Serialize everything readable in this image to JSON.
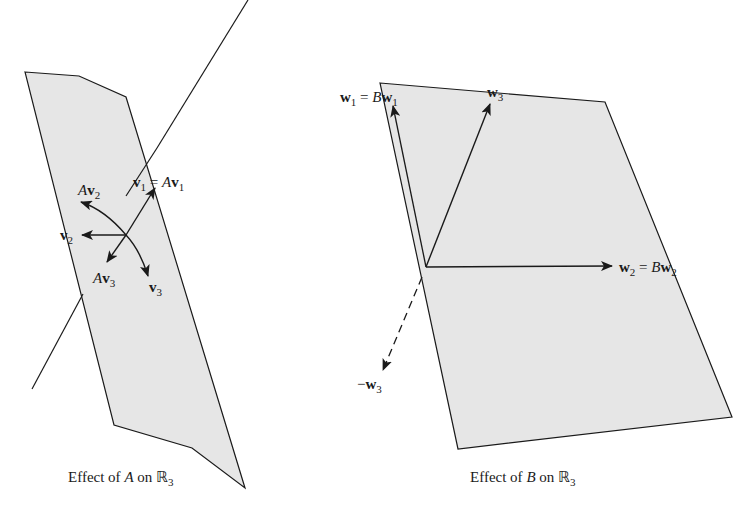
{
  "figure": {
    "left_panel": {
      "caption": "Effect of A on ℝ3",
      "caption_parts": {
        "prefix": "Effect of ",
        "matrix": "A",
        "mid": " on ",
        "space": "ℝ",
        "sub": "3"
      },
      "labels": {
        "v1": {
          "text": "v",
          "sub": "1",
          "eq": " = ",
          "rhs_matrix": "A",
          "rhs_vec": "v",
          "rhs_sub": "1"
        },
        "Av2": {
          "matrix": "A",
          "vec": "v",
          "sub": "2"
        },
        "v2": {
          "vec": "v",
          "sub": "2"
        },
        "Av3": {
          "matrix": "A",
          "vec": "v",
          "sub": "3"
        },
        "v3": {
          "vec": "v",
          "sub": "3"
        }
      }
    },
    "right_panel": {
      "caption": "Effect of B on ℝ3",
      "caption_parts": {
        "prefix": "Effect of ",
        "matrix": "B",
        "mid": " on ",
        "space": "ℝ",
        "sub": "3"
      },
      "labels": {
        "w1": {
          "vec": "w",
          "sub": "1",
          "eq": " = ",
          "rhs_matrix": "B",
          "rhs_vec": "w",
          "rhs_sub": "1"
        },
        "w3": {
          "vec": "w",
          "sub": "3"
        },
        "w2": {
          "vec": "w",
          "sub": "2",
          "eq": " = ",
          "rhs_matrix": "B",
          "rhs_vec": "w",
          "rhs_sub": "2"
        },
        "neg_w3": {
          "sign": "−",
          "vec": "w",
          "sub": "3"
        }
      }
    },
    "colors": {
      "plane_fill": "#e6e6e6",
      "stroke": "#1a1a1a",
      "background": "#ffffff"
    }
  }
}
